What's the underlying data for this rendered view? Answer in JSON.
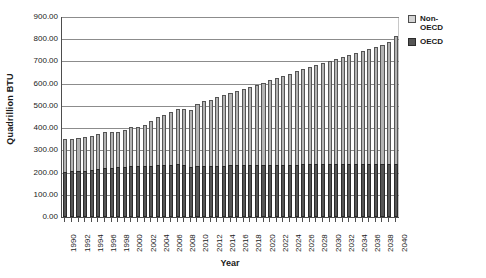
{
  "chart_data": {
    "type": "bar",
    "stacked": true,
    "title": "",
    "xlabel": "Year",
    "ylabel": "Quadrillion BTU",
    "ylim": [
      0,
      900
    ],
    "ytick_step": 100,
    "ytick_labels": [
      "900.00",
      "800.00",
      "700.00",
      "600.00",
      "500.00",
      "400.00",
      "300.00",
      "200.00",
      "100.00",
      "0.00"
    ],
    "grid": true,
    "legend_position": "right",
    "legend": [
      "Non-OECD",
      "OECD"
    ],
    "x_label_step": 2,
    "categories": [
      "1990",
      "1991",
      "1992",
      "1993",
      "1994",
      "1995",
      "1996",
      "1997",
      "1998",
      "1999",
      "2000",
      "2001",
      "2002",
      "2003",
      "2004",
      "2005",
      "2006",
      "2007",
      "2008",
      "2009",
      "2010",
      "2011",
      "2012",
      "2013",
      "2014",
      "2015",
      "2016",
      "2017",
      "2018",
      "2019",
      "2020",
      "2021",
      "2022",
      "2023",
      "2024",
      "2025",
      "2026",
      "2027",
      "2028",
      "2029",
      "2030",
      "2031",
      "2032",
      "2033",
      "2034",
      "2035",
      "2036",
      "2037",
      "2038",
      "2039",
      "2040"
    ],
    "visible_tick_labels": [
      "1990",
      "1992",
      "1994",
      "1996",
      "1998",
      "2000",
      "2002",
      "2004",
      "2006",
      "2008",
      "2010",
      "2012",
      "2014",
      "2016",
      "2018",
      "2020",
      "2022",
      "2024",
      "2026",
      "2028",
      "2030",
      "2032",
      "2034",
      "2036",
      "2038",
      "2040"
    ],
    "series": [
      {
        "name": "OECD",
        "color": "#555555",
        "values": [
          203,
          205,
          206,
          208,
          212,
          215,
          220,
          222,
          223,
          226,
          231,
          228,
          229,
          231,
          235,
          235,
          234,
          237,
          232,
          223,
          230,
          229,
          228,
          230,
          231,
          232,
          232,
          233,
          234,
          234,
          235,
          235,
          236,
          236,
          236,
          236,
          237,
          237,
          237,
          237,
          238,
          238,
          238,
          238,
          239,
          239,
          239,
          239,
          240,
          240,
          240
        ]
      },
      {
        "name": "Non-OECD",
        "color": "#b3b3b3",
        "values": [
          147,
          148,
          149,
          152,
          154,
          157,
          162,
          161,
          161,
          165,
          172,
          178,
          186,
          200,
          216,
          225,
          237,
          248,
          253,
          257,
          278,
          292,
          298,
          308,
          317,
          325,
          333,
          342,
          352,
          361,
          370,
          381,
          390,
          400,
          409,
          419,
          428,
          437,
          446,
          455,
          464,
          473,
          482,
          491,
          500,
          509,
          518,
          527,
          536,
          546,
          575
        ]
      }
    ],
    "totals": [
      350,
      353,
      355,
      360,
      366,
      372,
      382,
      383,
      384,
      391,
      403,
      406,
      415,
      431,
      451,
      460,
      471,
      485,
      485,
      480,
      508,
      521,
      526,
      538,
      548,
      557,
      565,
      575,
      586,
      595,
      605,
      616,
      626,
      636,
      645,
      655,
      665,
      674,
      683,
      692,
      702,
      711,
      720,
      729,
      739,
      748,
      757,
      766,
      776,
      786,
      815
    ]
  },
  "colors": {
    "nonoecd": "#b3b3b3",
    "oecd": "#555555",
    "axis": "#4d4d4d",
    "grid": "#8c8c8c",
    "background": "#ffffff"
  }
}
